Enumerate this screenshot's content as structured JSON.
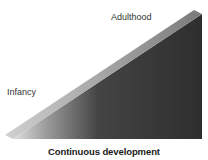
{
  "diagram": {
    "labels": {
      "top_right": "Adulthood",
      "left": "Infancy"
    },
    "caption": "Continuous development",
    "shape": "ramp",
    "colors": {
      "ramp_dark": "#303030",
      "ramp_light": "#d8d8d8",
      "bevel_light": "#c8c8c8",
      "bevel_dark": "#7a7a7a"
    }
  }
}
